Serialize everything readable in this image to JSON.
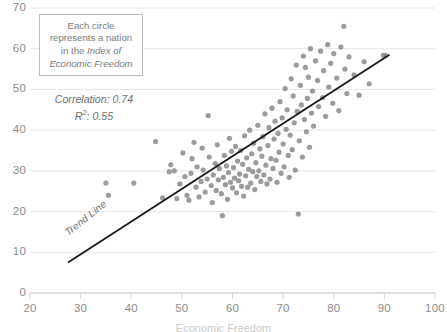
{
  "callout": {
    "line1": "Each circle",
    "line2": "represents a nation",
    "line3_plain": "in the ",
    "line3_italic": "Index of",
    "line4_italic": "Economic Freedom"
  },
  "stats": {
    "correlation_label": "Correlation: 0.74",
    "r2_label_prefix": "R",
    "r2_label_sup": "2",
    "r2_label_suffix": ": 0.55"
  },
  "trend_label": "Trend Line",
  "xaxis_title": "Economic Freedom",
  "colors": {
    "point": "#8a8a8a",
    "gridline": "#e6e6e6",
    "axis": "#d5d5d5",
    "tick_text": "#8c8c8c",
    "trend_line": "#1a1a1a",
    "callout_border": "#b9bcc4"
  },
  "chart_data": {
    "type": "scatter",
    "title": "",
    "xlabel": "Economic Freedom",
    "ylabel": "",
    "xlim": [
      20,
      100
    ],
    "ylim": [
      0,
      70
    ],
    "xticks": [
      20,
      30,
      40,
      50,
      60,
      70,
      80,
      90,
      100
    ],
    "yticks": [
      0,
      10,
      20,
      30,
      40,
      50,
      60,
      70
    ],
    "grid": "horizontal",
    "legend": "none",
    "annotations": [
      "Each circle represents a nation in the Index of Economic Freedom",
      "Correlation: 0.74",
      "R2: 0.55",
      "Trend Line"
    ],
    "statistics": {
      "correlation": 0.74,
      "r_squared": 0.55
    },
    "trend_line": {
      "x": [
        27.5,
        91.0
      ],
      "y": [
        7.5,
        58.5
      ]
    },
    "marker": {
      "shape": "circle",
      "radius_px": 2.6,
      "color": "#8a8a8a",
      "opacity": 0.85
    },
    "points": [
      [
        35.0,
        27.0
      ],
      [
        40.5,
        27.0
      ],
      [
        35.5,
        24.0
      ],
      [
        44.8,
        37.2
      ],
      [
        46.2,
        23.4
      ],
      [
        47.5,
        29.8
      ],
      [
        47.8,
        31.5
      ],
      [
        48.5,
        30.0
      ],
      [
        49.0,
        23.2
      ],
      [
        49.6,
        26.8
      ],
      [
        50.2,
        34.4
      ],
      [
        50.6,
        28.6
      ],
      [
        51.0,
        24.0
      ],
      [
        51.4,
        22.8
      ],
      [
        51.8,
        29.4
      ],
      [
        52.0,
        33.0
      ],
      [
        52.4,
        37.0
      ],
      [
        52.8,
        26.0
      ],
      [
        53.0,
        31.0
      ],
      [
        53.4,
        23.6
      ],
      [
        53.8,
        27.4
      ],
      [
        54.0,
        35.6
      ],
      [
        54.2,
        30.2
      ],
      [
        54.6,
        24.8
      ],
      [
        55.0,
        28.0
      ],
      [
        55.2,
        43.6
      ],
      [
        55.4,
        33.4
      ],
      [
        55.8,
        26.4
      ],
      [
        56.0,
        22.2
      ],
      [
        56.2,
        29.0
      ],
      [
        56.6,
        31.8
      ],
      [
        56.8,
        25.2
      ],
      [
        57.0,
        36.4
      ],
      [
        57.2,
        27.8
      ],
      [
        57.4,
        30.6
      ],
      [
        57.8,
        24.4
      ],
      [
        58.0,
        19.0
      ],
      [
        58.2,
        28.4
      ],
      [
        58.4,
        33.8
      ],
      [
        58.6,
        26.6
      ],
      [
        58.8,
        31.2
      ],
      [
        59.0,
        23.0
      ],
      [
        59.2,
        29.6
      ],
      [
        59.4,
        38.0
      ],
      [
        59.6,
        27.2
      ],
      [
        59.8,
        34.8
      ],
      [
        60.0,
        25.8
      ],
      [
        60.2,
        30.8
      ],
      [
        60.4,
        28.2
      ],
      [
        60.6,
        36.0
      ],
      [
        60.8,
        24.6
      ],
      [
        61.0,
        32.4
      ],
      [
        61.2,
        27.6
      ],
      [
        61.4,
        29.2
      ],
      [
        61.6,
        35.0
      ],
      [
        61.8,
        26.2
      ],
      [
        62.0,
        31.6
      ],
      [
        62.2,
        23.8
      ],
      [
        62.4,
        38.6
      ],
      [
        62.6,
        28.8
      ],
      [
        62.8,
        33.2
      ],
      [
        63.0,
        26.0
      ],
      [
        63.2,
        30.4
      ],
      [
        63.4,
        40.0
      ],
      [
        63.6,
        27.0
      ],
      [
        63.8,
        34.2
      ],
      [
        64.0,
        29.8
      ],
      [
        64.2,
        36.8
      ],
      [
        64.4,
        25.4
      ],
      [
        64.6,
        32.0
      ],
      [
        64.8,
        28.6
      ],
      [
        65.0,
        41.2
      ],
      [
        65.2,
        30.0
      ],
      [
        65.4,
        35.4
      ],
      [
        65.6,
        27.4
      ],
      [
        65.8,
        33.6
      ],
      [
        66.0,
        38.4
      ],
      [
        66.2,
        29.0
      ],
      [
        66.4,
        44.0
      ],
      [
        66.6,
        31.4
      ],
      [
        66.8,
        26.8
      ],
      [
        67.0,
        36.2
      ],
      [
        67.2,
        40.6
      ],
      [
        67.4,
        28.0
      ],
      [
        67.6,
        33.0
      ],
      [
        67.8,
        45.4
      ],
      [
        68.0,
        30.6
      ],
      [
        68.2,
        37.8
      ],
      [
        68.4,
        42.2
      ],
      [
        68.6,
        32.6
      ],
      [
        68.8,
        27.2
      ],
      [
        69.0,
        39.2
      ],
      [
        69.2,
        34.6
      ],
      [
        69.4,
        47.0
      ],
      [
        69.6,
        29.4
      ],
      [
        69.8,
        43.0
      ],
      [
        70.0,
        36.6
      ],
      [
        70.2,
        31.0
      ],
      [
        70.4,
        50.2
      ],
      [
        70.6,
        40.2
      ],
      [
        70.8,
        45.0
      ],
      [
        71.0,
        33.8
      ],
      [
        71.2,
        28.4
      ],
      [
        71.4,
        38.8
      ],
      [
        71.6,
        52.6
      ],
      [
        71.8,
        35.2
      ],
      [
        72.0,
        48.4
      ],
      [
        72.2,
        41.8
      ],
      [
        72.4,
        30.2
      ],
      [
        72.6,
        56.0
      ],
      [
        72.8,
        44.6
      ],
      [
        73.0,
        19.4
      ],
      [
        73.2,
        37.4
      ],
      [
        73.4,
        51.0
      ],
      [
        73.6,
        46.2
      ],
      [
        73.8,
        33.4
      ],
      [
        74.0,
        58.2
      ],
      [
        74.2,
        42.6
      ],
      [
        74.4,
        55.4
      ],
      [
        74.6,
        39.6
      ],
      [
        74.8,
        47.8
      ],
      [
        75.0,
        53.0
      ],
      [
        75.2,
        35.8
      ],
      [
        75.4,
        60.0
      ],
      [
        75.6,
        44.2
      ],
      [
        75.8,
        49.6
      ],
      [
        76.0,
        41.0
      ],
      [
        76.4,
        57.0
      ],
      [
        76.8,
        52.2
      ],
      [
        77.0,
        45.8
      ],
      [
        77.4,
        59.4
      ],
      [
        77.8,
        48.0
      ],
      [
        78.0,
        54.6
      ],
      [
        78.4,
        43.4
      ],
      [
        78.8,
        61.0
      ],
      [
        79.0,
        50.6
      ],
      [
        79.4,
        56.4
      ],
      [
        79.8,
        46.6
      ],
      [
        80.0,
        58.8
      ],
      [
        80.6,
        52.8
      ],
      [
        81.0,
        44.8
      ],
      [
        81.4,
        60.4
      ],
      [
        82.0,
        65.5
      ],
      [
        82.2,
        55.0
      ],
      [
        82.6,
        49.0
      ],
      [
        83.0,
        58.0
      ],
      [
        84.0,
        53.6
      ],
      [
        85.0,
        48.6
      ],
      [
        86.0,
        56.8
      ],
      [
        87.0,
        51.4
      ],
      [
        89.8,
        58.4
      ],
      [
        90.2,
        58.4
      ]
    ]
  }
}
